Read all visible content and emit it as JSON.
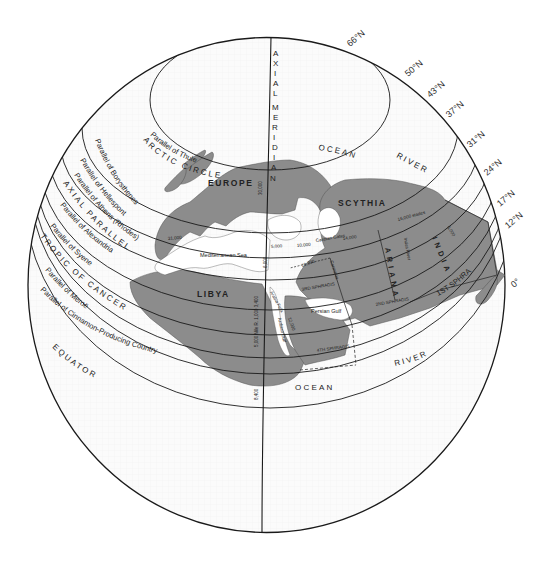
{
  "diagram": {
    "colors": {
      "globe_fill": "#fbfbfb",
      "land_fill": "#8c8c8c",
      "water_inland": "#ffffff",
      "line": "#1a1a1a"
    },
    "meridian": {
      "label": "AXIAL MERIDIAN",
      "letters": [
        "A",
        "X",
        "I",
        "A",
        "L",
        "M",
        "E",
        "R",
        "I",
        "D",
        "I",
        "A",
        "N"
      ]
    },
    "latitude_labels": [
      "66°N",
      "50°N",
      "43°N",
      "37°N",
      "31°N",
      "24°N",
      "17°N",
      "12°N",
      "0°"
    ],
    "parallels": [
      {
        "name": "Parallel of Thule"
      },
      {
        "name": "ARCTIC CIRCLE"
      },
      {
        "name": "Parallel of Borysthenes"
      },
      {
        "name": "Parallel of Hellespont"
      },
      {
        "name": "Parallel of Athens (Rhodes)"
      },
      {
        "name": "AXIAL PARALLEL"
      },
      {
        "name": "Parallel of Alexandria"
      },
      {
        "name": "Parallel of Syene"
      },
      {
        "name": "TROPIC OF CANCER"
      },
      {
        "name": "Parallel of Meroë"
      },
      {
        "name": "Parallel of Cinnamon-Producing Country"
      },
      {
        "name": "EQUATOR"
      }
    ],
    "regions": {
      "europe": "EUROPE",
      "scythia": "SCYTHIA",
      "libya": "LIBYA",
      "ariana": "ARIANA",
      "india": "INDIA"
    },
    "water_labels": {
      "ocean_north": "OCEAN",
      "river_north": "RIVER",
      "ocean_south": "OCEAN",
      "river_south": "RIVER",
      "mediterranean": "Mediterranean Sea",
      "persian_gulf": "Persian Gulf",
      "arabian_gulf": "Arabian Gulf"
    },
    "sphragis_labels": {
      "first": "1ST SPHRAGIS",
      "second": "2ND SPHRAGIS",
      "third": "3RD SPHRAGIS",
      "fourth": "4TH SPHRAGIS"
    },
    "distances": {
      "d_30000": "30,000",
      "d_31000": "31,000",
      "d_5000": "5,000",
      "d_10000": "10,000",
      "d_14000": "14,000",
      "d_16000_stades": "16,000 stades",
      "d_10300": "10,300",
      "d_6000": "6,000",
      "d_6000_b": "6,000",
      "nile_5000": "5,000 Nile R. 1,000 3,400",
      "d_8400": "8,400",
      "d_12000": "12,000",
      "caspian_gates": "Caspian Gates",
      "carmania": "Carmania",
      "indus_river": "Indus River",
      "arabia_felix": "Arabia Felix",
      "d_13000": "13,000"
    }
  }
}
